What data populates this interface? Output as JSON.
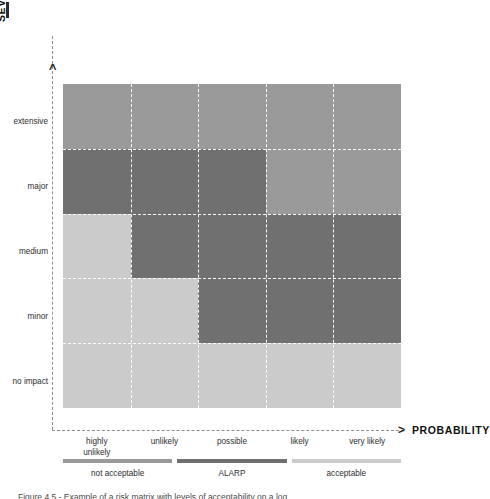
{
  "figure": {
    "caption": "Figure 4.5 - Example of a risk matrix with levels of acceptability on a log...",
    "colors": {
      "not_acceptable": "#9a9a9a",
      "alarp": "#707070",
      "acceptable": "#cbcbcb",
      "grid_line": "#ffffff",
      "axis_line": "#8c8c8c"
    }
  },
  "y_axis": {
    "title": "SEVERITY",
    "arrow": ">",
    "labels": [
      "extensive",
      "major",
      "medium",
      "minor",
      "no impact"
    ]
  },
  "x_axis": {
    "title": "PROBABILITY",
    "arrow": ">",
    "labels": [
      "highly\nunlikely",
      "unlikely",
      "possible",
      "likely",
      "very likely"
    ],
    "labels_flat": [
      "highly unlikely",
      "unlikely",
      "possible",
      "likely",
      "very likely"
    ]
  },
  "legend": {
    "items": [
      {
        "label": "not acceptable",
        "color": "#9a9a9a",
        "key": "not_acceptable"
      },
      {
        "label": "ALARP",
        "color": "#707070",
        "key": "alarp"
      },
      {
        "label": "acceptable",
        "color": "#cbcbcb",
        "key": "acceptable"
      }
    ]
  },
  "chart_data": {
    "type": "heatmap",
    "xlabel": "PROBABILITY",
    "ylabel": "SEVERITY",
    "grid": true,
    "legend_position": "bottom",
    "x_categories": [
      "highly unlikely",
      "unlikely",
      "possible",
      "likely",
      "very likely"
    ],
    "y_categories": [
      "extensive",
      "major",
      "medium",
      "minor",
      "no impact"
    ],
    "value_levels": [
      "not_acceptable",
      "alarp",
      "acceptable"
    ],
    "level_colors": {
      "not_acceptable": "#9a9a9a",
      "alarp": "#707070",
      "acceptable": "#cbcbcb"
    },
    "rows": [
      {
        "severity": "extensive",
        "cells": [
          "not_acceptable",
          "not_acceptable",
          "not_acceptable",
          "not_acceptable",
          "not_acceptable"
        ]
      },
      {
        "severity": "major",
        "cells": [
          "alarp",
          "alarp",
          "alarp",
          "not_acceptable",
          "not_acceptable"
        ]
      },
      {
        "severity": "medium",
        "cells": [
          "acceptable",
          "alarp",
          "alarp",
          "alarp",
          "alarp"
        ]
      },
      {
        "severity": "minor",
        "cells": [
          "acceptable",
          "acceptable",
          "alarp",
          "alarp",
          "alarp"
        ]
      },
      {
        "severity": "no impact",
        "cells": [
          "acceptable",
          "acceptable",
          "acceptable",
          "acceptable",
          "acceptable"
        ]
      }
    ]
  }
}
